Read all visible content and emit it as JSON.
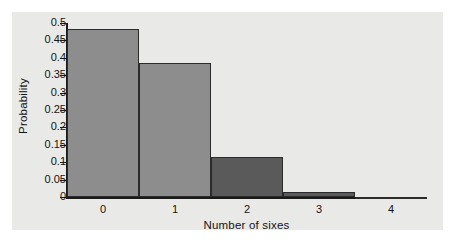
{
  "chart_data": {
    "type": "bar",
    "title": "",
    "subtitle": "",
    "xlabel": "Number of sixes",
    "ylabel": "Probability",
    "categories": [
      "0",
      "1",
      "2",
      "3",
      "4"
    ],
    "values": [
      0.482,
      0.386,
      0.116,
      0.015,
      0.001
    ],
    "ylim": [
      0,
      0.5
    ],
    "xlim": [
      -0.5,
      4.5
    ],
    "yticks": [
      "0",
      "0.05",
      "0.1",
      "0.15",
      "0.2",
      "0.25",
      "0.3",
      "0.35",
      "0.4",
      "0.45",
      "0.5"
    ],
    "ytick_values": [
      0,
      0.05,
      0.1,
      0.15,
      0.2,
      0.25,
      0.3,
      0.35,
      0.4,
      0.45,
      0.5
    ],
    "xticks": [
      "0",
      "1",
      "2",
      "3",
      "4"
    ],
    "grid": false,
    "legend": null,
    "legend_position": "none",
    "bar_width": 1.0,
    "bar_colors": [
      "#8d8d8d",
      "#8d8d8d",
      "#5a5a5a",
      "#5a5a5a",
      "#5a5a5a"
    ],
    "bar_edge_color": "#2b2b2b",
    "annotations": []
  },
  "figure": {
    "panel_background": "#e9e9e7",
    "page_background": "#ffffff",
    "axis_color": "#1a1a1a",
    "text_color": "#141414"
  }
}
